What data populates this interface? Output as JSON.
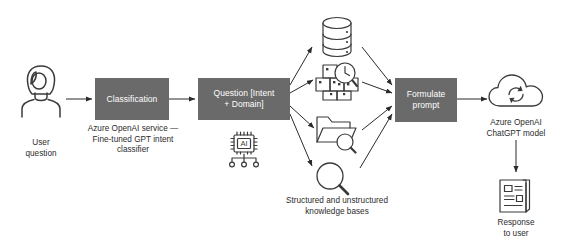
{
  "diagram": {
    "colors": {
      "box_fill": "#6a6a6a",
      "box_text": "#ffffff",
      "stroke": "#3a3a3a",
      "caption_text": "#2b2b2b",
      "background": "#ffffff"
    },
    "nodes": {
      "user": {
        "icon": "user-avatar-icon",
        "caption_line1": "User",
        "caption_line2": "question"
      },
      "classification": {
        "label": "Classification",
        "caption_line1": "Azure OpenAI service —",
        "caption_line2": "Fine-tuned GPT intent",
        "caption_line3": "classifier"
      },
      "question": {
        "label_line1": "Question [Intent",
        "label_line2": "+ Domain]",
        "icon": "ai-chip-icon",
        "icon_text": "AI"
      },
      "knowledge_bases": {
        "caption_line1": "Structured and unstructured",
        "caption_line2": "knowledge bases",
        "items": [
          {
            "icon": "database-cylinder-icon",
            "name": "database"
          },
          {
            "icon": "boxes-magnifier-icon",
            "name": "structured-data-search"
          },
          {
            "icon": "folder-magnifier-icon",
            "name": "document-search"
          },
          {
            "icon": "magnifier-icon",
            "name": "general-search"
          }
        ]
      },
      "formulate": {
        "label_line1": "Formulate",
        "label_line2": "prompt"
      },
      "model": {
        "icon": "cloud-sync-icon",
        "caption_line1": "Azure OpenAI",
        "caption_line2": "ChatGPT model"
      },
      "response": {
        "icon": "document-response-icon",
        "caption_line1": "Response",
        "caption_line2": "to user"
      }
    }
  }
}
